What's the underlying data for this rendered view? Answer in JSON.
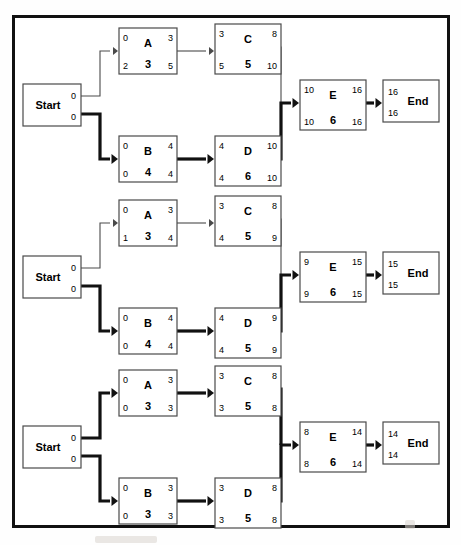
{
  "page": {
    "border_color": "#111111",
    "node_fill": "#ffffff",
    "node_stroke": "#4a4a4a",
    "critical_path_color": "#111111",
    "normal_path_color": "#4a4a4a"
  },
  "legend_keys": {
    "top_left": "early start",
    "top_right": "early finish",
    "bottom_left": "late start",
    "bottom_center": "duration",
    "bottom_right": "late finish"
  },
  "diagrams": [
    {
      "id": "diagram-1",
      "start": {
        "label": "Start",
        "top_right": "0",
        "bottom_right": "0"
      },
      "end": {
        "label": "End",
        "top_left": "16",
        "bottom_left": "16"
      },
      "nodes": [
        {
          "id": "A",
          "name": "A",
          "duration": "3",
          "es": "0",
          "ef": "3",
          "ls": "2",
          "lf": "5",
          "critical": false
        },
        {
          "id": "C",
          "name": "C",
          "duration": "5",
          "es": "3",
          "ef": "8",
          "ls": "5",
          "lf": "10",
          "critical": false
        },
        {
          "id": "B",
          "name": "B",
          "duration": "4",
          "es": "0",
          "ef": "4",
          "ls": "0",
          "lf": "4",
          "critical": true
        },
        {
          "id": "D",
          "name": "D",
          "duration": "6",
          "es": "4",
          "ef": "10",
          "ls": "4",
          "lf": "10",
          "critical": true
        },
        {
          "id": "E",
          "name": "E",
          "duration": "6",
          "es": "10",
          "ef": "16",
          "ls": "10",
          "lf": "16",
          "critical": true
        }
      ],
      "edges": [
        {
          "from": "Start",
          "to": "A",
          "critical": false
        },
        {
          "from": "A",
          "to": "C",
          "critical": false
        },
        {
          "from": "C",
          "to": "E",
          "critical": false
        },
        {
          "from": "Start",
          "to": "B",
          "critical": true
        },
        {
          "from": "B",
          "to": "D",
          "critical": true
        },
        {
          "from": "D",
          "to": "E",
          "critical": true
        },
        {
          "from": "E",
          "to": "End",
          "critical": true
        }
      ]
    },
    {
      "id": "diagram-2",
      "start": {
        "label": "Start",
        "top_right": "0",
        "bottom_right": "0"
      },
      "end": {
        "label": "End",
        "top_left": "15",
        "bottom_left": "15"
      },
      "nodes": [
        {
          "id": "A",
          "name": "A",
          "duration": "3",
          "es": "0",
          "ef": "3",
          "ls": "1",
          "lf": "4",
          "critical": false
        },
        {
          "id": "C",
          "name": "C",
          "duration": "5",
          "es": "3",
          "ef": "8",
          "ls": "4",
          "lf": "9",
          "critical": false
        },
        {
          "id": "B",
          "name": "B",
          "duration": "4",
          "es": "0",
          "ef": "4",
          "ls": "0",
          "lf": "4",
          "critical": true
        },
        {
          "id": "D",
          "name": "D",
          "duration": "5",
          "es": "4",
          "ef": "9",
          "ls": "4",
          "lf": "9",
          "critical": true
        },
        {
          "id": "E",
          "name": "E",
          "duration": "6",
          "es": "9",
          "ef": "15",
          "ls": "9",
          "lf": "15",
          "critical": true
        }
      ],
      "edges": [
        {
          "from": "Start",
          "to": "A",
          "critical": false
        },
        {
          "from": "A",
          "to": "C",
          "critical": false
        },
        {
          "from": "C",
          "to": "E",
          "critical": false
        },
        {
          "from": "Start",
          "to": "B",
          "critical": true
        },
        {
          "from": "B",
          "to": "D",
          "critical": true
        },
        {
          "from": "D",
          "to": "E",
          "critical": true
        },
        {
          "from": "E",
          "to": "End",
          "critical": true
        }
      ]
    },
    {
      "id": "diagram-3",
      "start": {
        "label": "Start",
        "top_right": "0",
        "bottom_right": "0"
      },
      "end": {
        "label": "End",
        "top_left": "14",
        "bottom_left": "14"
      },
      "nodes": [
        {
          "id": "A",
          "name": "A",
          "duration": "3",
          "es": "0",
          "ef": "3",
          "ls": "0",
          "lf": "3",
          "critical": true
        },
        {
          "id": "C",
          "name": "C",
          "duration": "5",
          "es": "3",
          "ef": "8",
          "ls": "3",
          "lf": "8",
          "critical": true
        },
        {
          "id": "B",
          "name": "B",
          "duration": "3",
          "es": "0",
          "ef": "3",
          "ls": "0",
          "lf": "3",
          "critical": true
        },
        {
          "id": "D",
          "name": "D",
          "duration": "5",
          "es": "3",
          "ef": "8",
          "ls": "3",
          "lf": "8",
          "critical": true
        },
        {
          "id": "E",
          "name": "E",
          "duration": "6",
          "es": "8",
          "ef": "14",
          "ls": "8",
          "lf": "14",
          "critical": true
        }
      ],
      "edges": [
        {
          "from": "Start",
          "to": "A",
          "critical": true
        },
        {
          "from": "A",
          "to": "C",
          "critical": true
        },
        {
          "from": "C",
          "to": "E",
          "critical": true
        },
        {
          "from": "Start",
          "to": "B",
          "critical": true
        },
        {
          "from": "B",
          "to": "D",
          "critical": true
        },
        {
          "from": "D",
          "to": "E",
          "critical": true
        },
        {
          "from": "E",
          "to": "End",
          "critical": true
        }
      ]
    }
  ]
}
